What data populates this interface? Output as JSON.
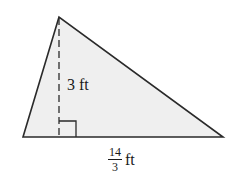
{
  "diagram": {
    "type": "triangle",
    "fill_color": "#efefef",
    "stroke_color": "#2a2a2a",
    "vertices": {
      "apex": [
        59,
        17
      ],
      "bottom_left": [
        23,
        137
      ],
      "bottom_right": [
        223,
        137
      ]
    },
    "altitude": {
      "from": [
        59,
        17
      ],
      "to": [
        59,
        137
      ],
      "style": "dashed"
    },
    "right_angle_marker": {
      "corner": [
        59,
        137
      ],
      "size": 16
    },
    "height_label": {
      "value": "3",
      "unit": "ft",
      "text": "3 ft"
    },
    "base_label": {
      "numerator": "14",
      "denominator": "3",
      "unit": "ft"
    }
  }
}
